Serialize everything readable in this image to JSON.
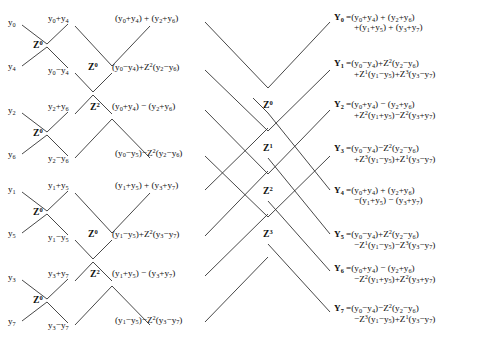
{
  "diagram": {
    "stroke_color": "#333333",
    "background": "#ffffff",
    "inputs": [
      {
        "name": "y0",
        "html": "y<sub>0</sub>",
        "x": 8,
        "y": 18
      },
      {
        "name": "y4",
        "html": "y<sub>4</sub>",
        "x": 8,
        "y": 62
      },
      {
        "name": "y2",
        "html": "y<sub>2</sub>",
        "x": 8,
        "y": 106
      },
      {
        "name": "y6",
        "html": "y<sub>6</sub>",
        "x": 8,
        "y": 150
      },
      {
        "name": "y1",
        "html": "y<sub>1</sub>",
        "x": 8,
        "y": 185
      },
      {
        "name": "y5",
        "html": "y<sub>5</sub>",
        "x": 8,
        "y": 229
      },
      {
        "name": "y3",
        "html": "y<sub>3</sub>",
        "x": 8,
        "y": 273
      },
      {
        "name": "y7",
        "html": "y<sub>7</sub>",
        "x": 8,
        "y": 317
      }
    ],
    "stage1_twiddles": [
      {
        "name": "z0-a",
        "html": "Z<sup>0</sup>",
        "x": 33,
        "y": 40
      },
      {
        "name": "z0-b",
        "html": "Z<sup>0</sup>",
        "x": 33,
        "y": 128
      },
      {
        "name": "z0-c",
        "html": "Z<sup>0</sup>",
        "x": 33,
        "y": 207
      },
      {
        "name": "z0-d",
        "html": "Z<sup>0</sup>",
        "x": 33,
        "y": 295
      }
    ],
    "stage1_outputs": [
      {
        "name": "y0-plus-y4",
        "html": "y<sub>0</sub>+y<sub>4</sub>",
        "x": 48,
        "y": 14
      },
      {
        "name": "y0-minus-y4",
        "html": "y<sub>0</sub>−y<sub>4</sub>",
        "x": 48,
        "y": 66
      },
      {
        "name": "y2-plus-y6",
        "html": "y<sub>2</sub>+y<sub>6</sub>",
        "x": 48,
        "y": 102
      },
      {
        "name": "y2-minus-y6",
        "html": "y<sub>2</sub>−y<sub>6</sub>",
        "x": 48,
        "y": 154
      },
      {
        "name": "y1-plus-y5",
        "html": "y<sub>1</sub>+y<sub>5</sub>",
        "x": 48,
        "y": 181
      },
      {
        "name": "y1-minus-y5",
        "html": "y<sub>1</sub>−y<sub>5</sub>",
        "x": 48,
        "y": 233
      },
      {
        "name": "y3-plus-y7",
        "html": "y<sub>3</sub>+y<sub>7</sub>",
        "x": 48,
        "y": 269
      },
      {
        "name": "y3-minus-y7",
        "html": "y<sub>3</sub>−y<sub>7</sub>",
        "x": 48,
        "y": 321
      }
    ],
    "stage2_twiddles": [
      {
        "name": "z0-top",
        "html": "Z<sup>0</sup>",
        "x": 88,
        "y": 62
      },
      {
        "name": "z2-top",
        "html": "Z<sup>2</sup>",
        "x": 90,
        "y": 102
      },
      {
        "name": "z0-bot",
        "html": "Z<sup>0</sup>",
        "x": 88,
        "y": 229
      },
      {
        "name": "z2-bot",
        "html": "Z<sup>2</sup>",
        "x": 90,
        "y": 269
      }
    ],
    "stage2_outputs": [
      {
        "name": "expr-a",
        "html": "(y<sub>0</sub>+y<sub>4</sub>) + (y<sub>2</sub>+y<sub>6</sub>)",
        "x": 115,
        "y": 14
      },
      {
        "name": "expr-b",
        "html": "(y<sub>0</sub>−y<sub>4</sub>)+Z<sup>2</sup>(y<sub>2</sub>−y<sub>6</sub>)",
        "x": 112,
        "y": 62
      },
      {
        "name": "expr-c",
        "html": "(y<sub>0</sub>+y<sub>4</sub>) − (y<sub>2</sub>+y<sub>6</sub>)",
        "x": 112,
        "y": 102
      },
      {
        "name": "expr-d",
        "html": "(y<sub>0</sub>−y<sub>5</sub>)−Z<sup>2</sup>(y<sub>2</sub>−y<sub>6</sub>)",
        "x": 115,
        "y": 148
      },
      {
        "name": "expr-e",
        "html": "(y<sub>1</sub>+y<sub>5</sub>) + (y<sub>3</sub>+y<sub>7</sub>)",
        "x": 115,
        "y": 181
      },
      {
        "name": "expr-f",
        "html": "(y<sub>1</sub>−y<sub>5</sub>)+Z<sup>2</sup>(y<sub>3</sub>−y<sub>7</sub>)",
        "x": 112,
        "y": 229
      },
      {
        "name": "expr-g",
        "html": "(y<sub>1</sub>+y<sub>5</sub>) − (y<sub>3</sub>+y<sub>7</sub>)",
        "x": 112,
        "y": 269
      },
      {
        "name": "expr-h",
        "html": "(y<sub>1</sub>−y<sub>5</sub>)−Z<sup>2</sup>(y<sub>3</sub>−y<sub>7</sub>)",
        "x": 115,
        "y": 315
      }
    ],
    "stage3_twiddles": [
      {
        "name": "z0-mid",
        "html": "Z<sup>0</sup>",
        "x": 263,
        "y": 100
      },
      {
        "name": "z1-mid",
        "html": "Z<sup>1</sup>",
        "x": 263,
        "y": 143
      },
      {
        "name": "z2-mid",
        "html": "Z<sup>2</sup>",
        "x": 263,
        "y": 186
      },
      {
        "name": "z3-mid",
        "html": "Z<sup>3</sup>",
        "x": 263,
        "y": 229
      }
    ],
    "outputs": [
      {
        "name": "Y0",
        "head": "Y<sub>0</sub> =",
        "line1": "(y<sub>0</sub>+y<sub>4</sub>) + (y<sub>2</sub>+y<sub>6</sub>)",
        "line2": "+(y<sub>1</sub>+y<sub>5</sub>) + (y<sub>3</sub>+y<sub>7</sub>)",
        "x": 334,
        "y": 13
      },
      {
        "name": "Y1",
        "head": "Y<sub>1</sub> =",
        "line1": "(y<sub>0</sub>−y<sub>4</sub>)+Z<sup>2</sup>(y<sub>2</sub>−y<sub>6</sub>)",
        "line2": "+Z<sup>1</sup>(y<sub>1</sub>−y<sub>5</sub>)+Z<sup>3</sup>(y<sub>3</sub>−y<sub>7</sub>)",
        "x": 334,
        "y": 58
      },
      {
        "name": "Y2",
        "head": "Y<sub>2</sub> =",
        "line1": "(y<sub>0</sub>+y<sub>4</sub>) − (y<sub>2</sub>+y<sub>6</sub>)",
        "line2": "+Z<sup>2</sup>(y<sub>1</sub>+y<sub>5</sub>)−Z<sup>2</sup>(y<sub>3</sub>+y<sub>7</sub>)",
        "x": 334,
        "y": 100
      },
      {
        "name": "Y3",
        "head": "Y<sub>3</sub> =",
        "line1": "(y<sub>0</sub>−y<sub>4</sub>)−Z<sup>2</sup>(y<sub>2</sub>−y<sub>6</sub>)",
        "line2": "+Z<sup>3</sup>(y<sub>1</sub>−y<sub>5</sub>)+Z<sup>1</sup>(y<sub>3</sub>−y<sub>7</sub>)",
        "x": 334,
        "y": 143
      },
      {
        "name": "Y4",
        "head": "Y<sub>4</sub> =",
        "line1": "(y<sub>0</sub>+y<sub>4</sub>) + (y<sub>2</sub>+y<sub>6</sub>)",
        "line2": "−(y<sub>1</sub>+y<sub>5</sub>) − (y<sub>3</sub>+y<sub>7</sub>)",
        "x": 334,
        "y": 186
      },
      {
        "name": "Y5",
        "head": "Y<sub>5</sub> =",
        "line1": "(y<sub>0</sub>−y<sub>4</sub>)+Z<sup>2</sup>(y<sub>2</sub>−y<sub>6</sub>)",
        "line2": "−Z<sup>1</sup>(y<sub>1</sub>−y<sub>5</sub>)−Z<sup>3</sup>(y<sub>3</sub>−y<sub>7</sub>)",
        "x": 334,
        "y": 229
      },
      {
        "name": "Y6",
        "head": "Y<sub>6</sub> =",
        "line1": "(y<sub>0</sub>+y<sub>4</sub>) − (y<sub>2</sub>+y<sub>6</sub>)",
        "line2": "−Z<sup>2</sup>(y<sub>1</sub>+y<sub>5</sub>)+Z<sup>2</sup>(y<sub>3</sub>+y<sub>7</sub>)",
        "x": 334,
        "y": 264
      },
      {
        "name": "Y7",
        "head": "Y<sub>7</sub> =",
        "line1": "(y<sub>0</sub>−y<sub>4</sub>)−Z<sup>2</sup>(y<sub>2</sub>−y<sub>6</sub>)",
        "line2": "−Z<sup>3</sup>(y<sub>1</sub>−y<sub>5</sub>)+Z<sup>1</sup>(y<sub>3</sub>−y<sub>7</sub>)",
        "x": 334,
        "y": 303
      }
    ],
    "edges": [
      {
        "name": "s1-e1",
        "x1": 22,
        "y1": 25,
        "x2": 47,
        "y2": 44
      },
      {
        "name": "s1-e2",
        "x1": 47,
        "y1": 44,
        "x2": 68,
        "y2": 24
      },
      {
        "name": "s1-e3",
        "x1": 22,
        "y1": 66,
        "x2": 47,
        "y2": 47
      },
      {
        "name": "s1-e4",
        "x1": 47,
        "y1": 47,
        "x2": 68,
        "y2": 68
      },
      {
        "name": "s1-e5",
        "x1": 22,
        "y1": 113,
        "x2": 47,
        "y2": 132
      },
      {
        "name": "s1-e6",
        "x1": 47,
        "y1": 132,
        "x2": 68,
        "y2": 112
      },
      {
        "name": "s1-e7",
        "x1": 22,
        "y1": 154,
        "x2": 47,
        "y2": 135
      },
      {
        "name": "s1-e8",
        "x1": 47,
        "y1": 135,
        "x2": 68,
        "y2": 156
      },
      {
        "name": "s1-e9",
        "x1": 22,
        "y1": 192,
        "x2": 47,
        "y2": 211
      },
      {
        "name": "s1-e10",
        "x1": 47,
        "y1": 211,
        "x2": 68,
        "y2": 191
      },
      {
        "name": "s1-e11",
        "x1": 22,
        "y1": 233,
        "x2": 47,
        "y2": 214
      },
      {
        "name": "s1-e12",
        "x1": 47,
        "y1": 214,
        "x2": 68,
        "y2": 235
      },
      {
        "name": "s1-e13",
        "x1": 22,
        "y1": 280,
        "x2": 47,
        "y2": 299
      },
      {
        "name": "s1-e14",
        "x1": 47,
        "y1": 299,
        "x2": 68,
        "y2": 279
      },
      {
        "name": "s1-e15",
        "x1": 22,
        "y1": 321,
        "x2": 47,
        "y2": 302
      },
      {
        "name": "s1-e16",
        "x1": 47,
        "y1": 302,
        "x2": 68,
        "y2": 323
      },
      {
        "name": "s2-e1",
        "x1": 75,
        "y1": 26,
        "x2": 112,
        "y2": 66
      },
      {
        "name": "s2-e2",
        "x1": 112,
        "y1": 66,
        "x2": 150,
        "y2": 26
      },
      {
        "name": "s2-e3",
        "x1": 75,
        "y1": 73,
        "x2": 93,
        "y2": 92
      },
      {
        "name": "s2-e4",
        "x1": 93,
        "y1": 92,
        "x2": 112,
        "y2": 73
      },
      {
        "name": "s2-e5",
        "x1": 75,
        "y1": 114,
        "x2": 93,
        "y2": 95
      },
      {
        "name": "s2-e6",
        "x1": 93,
        "y1": 95,
        "x2": 112,
        "y2": 114
      },
      {
        "name": "s2-e7",
        "x1": 75,
        "y1": 158,
        "x2": 112,
        "y2": 119
      },
      {
        "name": "s2-e8",
        "x1": 112,
        "y1": 119,
        "x2": 150,
        "y2": 158
      },
      {
        "name": "s2-e9",
        "x1": 75,
        "y1": 193,
        "x2": 112,
        "y2": 233
      },
      {
        "name": "s2-e10",
        "x1": 112,
        "y1": 233,
        "x2": 150,
        "y2": 193
      },
      {
        "name": "s2-e11",
        "x1": 75,
        "y1": 240,
        "x2": 93,
        "y2": 259
      },
      {
        "name": "s2-e12",
        "x1": 93,
        "y1": 259,
        "x2": 112,
        "y2": 240
      },
      {
        "name": "s2-e13",
        "x1": 75,
        "y1": 281,
        "x2": 93,
        "y2": 262
      },
      {
        "name": "s2-e14",
        "x1": 93,
        "y1": 262,
        "x2": 112,
        "y2": 281
      },
      {
        "name": "s2-e15",
        "x1": 75,
        "y1": 325,
        "x2": 112,
        "y2": 286
      },
      {
        "name": "s2-e16",
        "x1": 112,
        "y1": 286,
        "x2": 150,
        "y2": 325
      },
      {
        "name": "s3-e1",
        "x1": 205,
        "y1": 22,
        "x2": 268,
        "y2": 88
      },
      {
        "name": "s3-e2",
        "x1": 268,
        "y1": 88,
        "x2": 330,
        "y2": 22
      },
      {
        "name": "s3-e3",
        "x1": 205,
        "y1": 70,
        "x2": 268,
        "y2": 131
      },
      {
        "name": "s3-e4",
        "x1": 268,
        "y1": 131,
        "x2": 330,
        "y2": 70
      },
      {
        "name": "s3-e5",
        "x1": 205,
        "y1": 110,
        "x2": 268,
        "y2": 174
      },
      {
        "name": "s3-e6",
        "x1": 268,
        "y1": 174,
        "x2": 330,
        "y2": 110
      },
      {
        "name": "s3-e7",
        "x1": 205,
        "y1": 156,
        "x2": 268,
        "y2": 217
      },
      {
        "name": "s3-e8",
        "x1": 268,
        "y1": 217,
        "x2": 330,
        "y2": 156
      },
      {
        "name": "s3-e9",
        "x1": 205,
        "y1": 190,
        "x2": 253,
        "y2": 143
      },
      {
        "name": "s3-e10",
        "x1": 253,
        "y1": 143,
        "x2": 268,
        "y2": 128
      },
      {
        "name": "s3-e11",
        "x1": 268,
        "y1": 113,
        "x2": 330,
        "y2": 190
      },
      {
        "name": "s3-e12",
        "x1": 268,
        "y1": 113,
        "x2": 253,
        "y2": 98
      },
      {
        "name": "s3-e13",
        "x1": 205,
        "y1": 236,
        "x2": 268,
        "y2": 171
      },
      {
        "name": "s3-e14",
        "x1": 268,
        "y1": 158,
        "x2": 330,
        "y2": 234
      },
      {
        "name": "s3-e15",
        "x1": 205,
        "y1": 276,
        "x2": 268,
        "y2": 214
      },
      {
        "name": "s3-e16",
        "x1": 268,
        "y1": 201,
        "x2": 330,
        "y2": 271
      },
      {
        "name": "s3-e17",
        "x1": 205,
        "y1": 322,
        "x2": 268,
        "y2": 257
      },
      {
        "name": "s3-e18",
        "x1": 268,
        "y1": 244,
        "x2": 330,
        "y2": 312
      }
    ]
  }
}
